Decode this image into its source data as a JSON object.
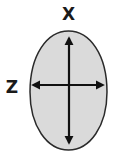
{
  "diagram": {
    "title": "",
    "shape": "ellipse",
    "fill_color": "#dadada",
    "stroke_color": "#2a2a2a",
    "arrow_color": "#111111",
    "axes": [
      {
        "id": "vertical",
        "label": "X",
        "direction": "vertical",
        "bidirectional": true
      },
      {
        "id": "horizontal",
        "label": "Z",
        "direction": "horizontal",
        "bidirectional": true
      }
    ]
  }
}
